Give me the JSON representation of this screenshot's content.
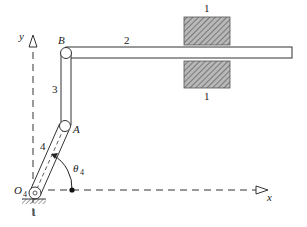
{
  "diagram": {
    "colors": {
      "line": "#333333",
      "ground_fill": "#999999",
      "background": "#ffffff"
    },
    "axes": {
      "x_label": "x",
      "y_label": "y"
    },
    "joints": {
      "B_label": "B",
      "A_label": "A",
      "O4_label_main": "O",
      "O4_label_sub": "4"
    },
    "links": {
      "link2_label": "2",
      "link3_label": "3",
      "link4_label": "4"
    },
    "ground": {
      "upper_guide_label": "1",
      "lower_guide_label": "1",
      "pivot_ground_label": "1"
    },
    "angle": {
      "symbol": "θ",
      "subscript": "4"
    }
  }
}
